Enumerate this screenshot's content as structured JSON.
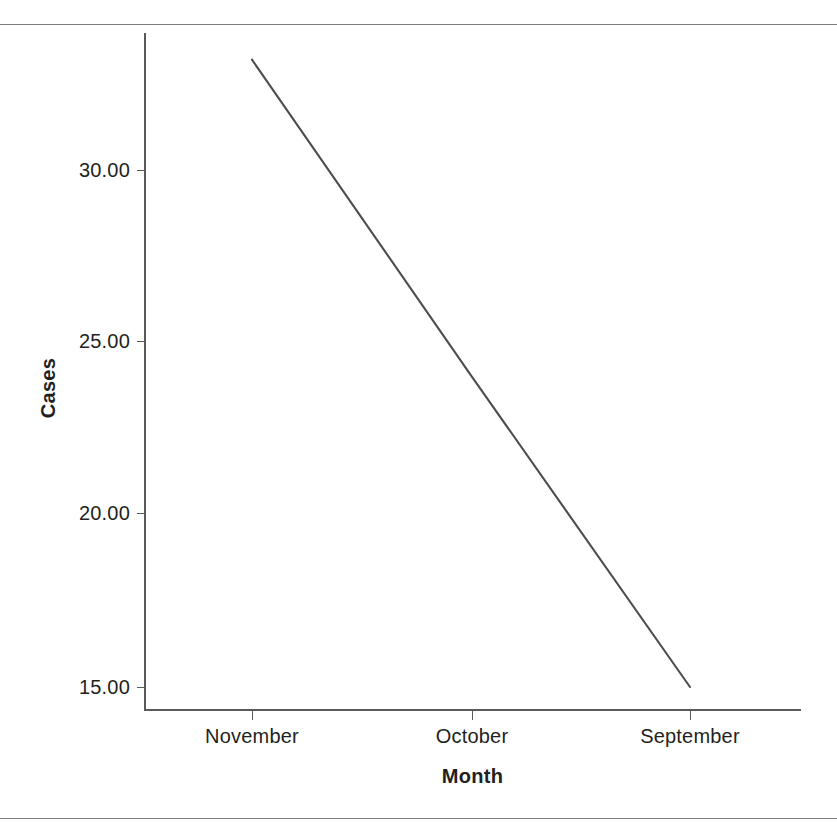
{
  "chart_data": {
    "type": "line",
    "title": "",
    "xlabel": "Month",
    "ylabel": "Cases",
    "categories": [
      "November",
      "October",
      "September"
    ],
    "x": [
      "November",
      "October",
      "September"
    ],
    "values": [
      33.2,
      24.0,
      15.0
    ],
    "series": [
      {
        "name": "Cases",
        "values": [
          33.2,
          24.0,
          15.0
        ],
        "color": "#4d4d4f"
      }
    ],
    "y_ticks": [
      15.0,
      20.0,
      25.0,
      30.0
    ],
    "y_tick_labels": [
      "15.00",
      "20.00",
      "25.00",
      "30.00"
    ],
    "x_tick_labels": [
      "November",
      "October",
      "September"
    ],
    "ylim": [
      13.4,
      33.8
    ],
    "grid": false,
    "legend": false,
    "legend_position": "none",
    "annotations": []
  },
  "axes": {
    "y_title": "Cases",
    "x_title": "Month",
    "y_labels": {
      "t30": "30.00",
      "t25": "25.00",
      "t20": "20.00",
      "t15": "15.00"
    },
    "x_labels": {
      "c0": "November",
      "c1": "October",
      "c2": "September"
    }
  },
  "colors": {
    "line": "#4d4d4f",
    "axis": "#58595b",
    "rule": "#7d7f82",
    "text": "#231f20",
    "background": "#ffffff"
  }
}
